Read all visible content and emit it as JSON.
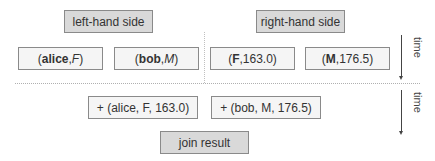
{
  "headers": {
    "left": "left-hand side",
    "right": "right-hand side"
  },
  "left_tuples": [
    {
      "open": "(",
      "name": "alice",
      "sep": ", ",
      "value": "F",
      "close": ")"
    },
    {
      "open": "(",
      "name": "bob",
      "sep": ", ",
      "value": "M",
      "close": ")"
    }
  ],
  "right_tuples": [
    {
      "open": "(",
      "key": "F",
      "sep": ", ",
      "value": "163.0",
      "close": ")"
    },
    {
      "open": "(",
      "key": "M",
      "sep": ", ",
      "value": "176.5",
      "close": ")"
    }
  ],
  "join_tuples": [
    "+ (alice, F, 163.0)",
    "+ (bob, M, 176.5)"
  ],
  "result_label": "join result",
  "axis": {
    "top_label": "time",
    "bottom_label": "time"
  }
}
